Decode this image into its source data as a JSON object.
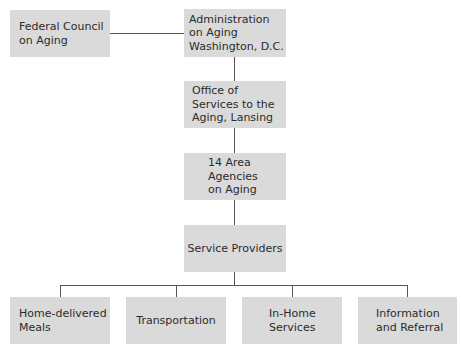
{
  "diagram": {
    "type": "org-chart",
    "colors": {
      "box_fill": "#dadada",
      "text": "#2b2b2b",
      "line": "#555555"
    },
    "nodes": {
      "federal_council": {
        "label": "Federal Council\non Aging"
      },
      "administration": {
        "label": "Administration\non Aging\nWashington, D.C."
      },
      "office": {
        "label": "Office of\nServices to the\nAging, Lansing"
      },
      "area_agencies": {
        "label": "14 Area\nAgencies\non Aging"
      },
      "service_providers": {
        "label": "Service Providers"
      },
      "services": [
        {
          "label": "Home-delivered\nMeals"
        },
        {
          "label": "Transportation"
        },
        {
          "label": "In-Home\nServices"
        },
        {
          "label": "Information\nand Referral"
        }
      ]
    },
    "edges": [
      [
        "federal_council",
        "administration"
      ],
      [
        "administration",
        "office"
      ],
      [
        "office",
        "area_agencies"
      ],
      [
        "area_agencies",
        "service_providers"
      ],
      [
        "service_providers",
        "services.0"
      ],
      [
        "service_providers",
        "services.1"
      ],
      [
        "service_providers",
        "services.2"
      ],
      [
        "service_providers",
        "services.3"
      ]
    ]
  }
}
